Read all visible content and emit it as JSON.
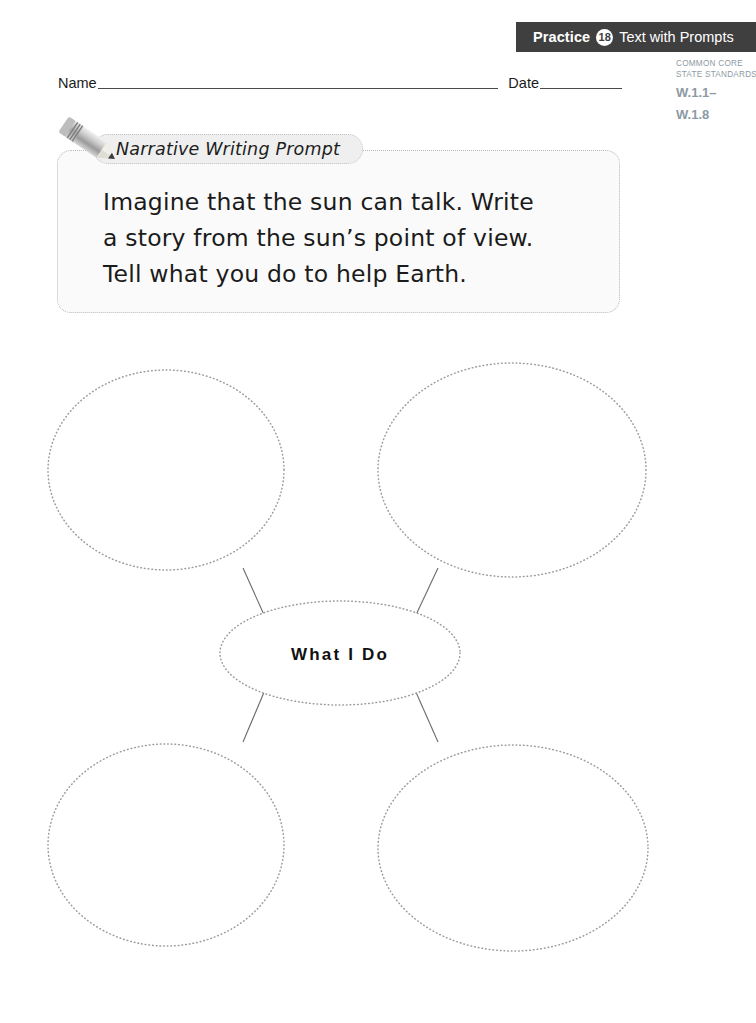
{
  "header": {
    "practice_label": "Practice",
    "practice_number": "18",
    "subject_label": "Text with Prompts"
  },
  "standards": {
    "line1": "Common Core",
    "line2": "State Standards",
    "code1": "W.1.1–",
    "code2": "W.1.8"
  },
  "name_date": {
    "name_label": "Name",
    "date_label": "Date"
  },
  "prompt": {
    "tab_label": "Narrative Writing Prompt",
    "icon": "pencil-icon",
    "line1": "Imagine that the sun can talk. Write",
    "line2": "a story from the sun’s point of view.",
    "line3": "Tell what you do to help Earth."
  },
  "graphic_organizer": {
    "type": "web-diagram",
    "center_label": "What I Do",
    "outer_ovals": [
      {
        "position": "top-left",
        "label": ""
      },
      {
        "position": "top-right",
        "label": ""
      },
      {
        "position": "bottom-left",
        "label": ""
      },
      {
        "position": "bottom-right",
        "label": ""
      }
    ]
  },
  "colors": {
    "banner_bg": "#3f3f3f",
    "banner_text": "#ffffff",
    "standards_text": "#8d9aa3",
    "dotted_border": "#b9b9b9",
    "prompt_fill": "#fafafa",
    "tab_fill": "#efefef",
    "connector_line": "#6b6b6b"
  }
}
